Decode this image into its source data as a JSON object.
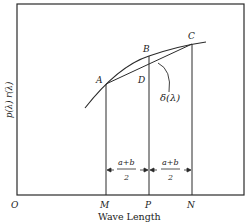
{
  "diagram": {
    "x_axis_label": "Wave Length",
    "y_axis_label": "p(λ) r(λ)",
    "origin_label": "O",
    "points": {
      "A": "A",
      "B": "B",
      "C": "C",
      "D": "D"
    },
    "baseline_points": {
      "M": "M",
      "P": "P",
      "N": "N"
    },
    "delta_label": "δ(λ)",
    "intervals": [
      {
        "numerator": "a+b",
        "denominator": "2"
      },
      {
        "numerator": "a+b",
        "denominator": "2"
      }
    ],
    "colors": {
      "line": "#2a2a2a",
      "background": "#ffffff"
    }
  }
}
